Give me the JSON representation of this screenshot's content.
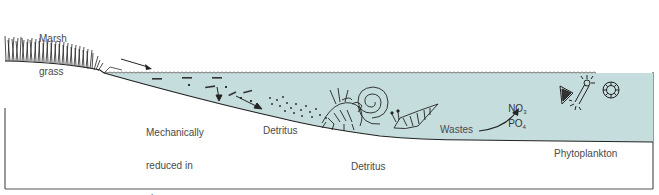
{
  "diagram": {
    "colors": {
      "water": "#c6dddd",
      "line": "#1e1e1e",
      "frame": "#555555",
      "text": "#4a4a4a"
    },
    "labels": {
      "marsh_grass_line1": "Marsh",
      "marsh_grass_line2": "grass",
      "mechanical_line1": "Mechanically",
      "mechanical_line2": "reduced in",
      "mechanical_line3": "size",
      "detritus": "Detritus",
      "feeders_line1": "Detritus",
      "feeders_line2": "feeders",
      "feeders_line3": "(crabs, snails)",
      "wastes": "Wastes",
      "nitrate": "NO",
      "nitrate_sub": "3",
      "phosphate": "PO",
      "phosphate_sub": "4",
      "phytoplankton": "Phytoplankton"
    },
    "elements": [
      {
        "name": "marsh-grass",
        "icon": "grass-icon"
      },
      {
        "name": "water-body",
        "icon": "water-icon"
      },
      {
        "name": "detritus-particles",
        "icon": "particles-icon"
      },
      {
        "name": "crab",
        "icon": "crab-icon"
      },
      {
        "name": "snail",
        "icon": "snail-icon"
      },
      {
        "name": "phytoplankton",
        "icon": "plankton-icon"
      }
    ],
    "flow": [
      "Marsh grass",
      "Mechanically reduced in size",
      "Detritus",
      "Detritus feeders (crabs, snails)",
      "Wastes",
      "NO3 PO4",
      "Phytoplankton"
    ]
  }
}
